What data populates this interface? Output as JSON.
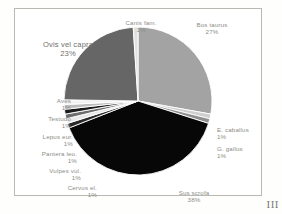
{
  "figure": {
    "plate_label": "III"
  },
  "chart_data": {
    "type": "pie",
    "title": "",
    "legend": "none (labels placed around slices)",
    "units": "percent",
    "categories": [
      "Bos taurus",
      "Sus scrofa",
      "Cervus el.",
      "Vulpes vul.",
      "Pantera leo.",
      "Lepus eur.",
      "Testudo",
      "Aves",
      "Ovis vel capra",
      "Canis fam.",
      "E. caballus",
      "G. gallus"
    ],
    "values": [
      27,
      38,
      1,
      1,
      1,
      1,
      1,
      1,
      23,
      1,
      1,
      1
    ],
    "slices": [
      {
        "label": "Bos taurus",
        "percent": 27,
        "percent_text": "27%",
        "color": "#a3a3a3"
      },
      {
        "label": "E. caballus",
        "percent": 1,
        "percent_text": "1%",
        "color": "#cfcfcf"
      },
      {
        "label": "G. gallus",
        "percent": 1,
        "percent_text": "1%",
        "color": "#8f8f8f"
      },
      {
        "label": "Sus scrofa",
        "percent": 38,
        "percent_text": "38%",
        "color": "#070707"
      },
      {
        "label": "Cervus el.",
        "percent": 1,
        "percent_text": "1%",
        "color": "#2b2b2b"
      },
      {
        "label": "Vulpes vul.",
        "percent": 1,
        "percent_text": "1%",
        "color": "#e8e8e8"
      },
      {
        "label": "Pantera leo.",
        "percent": 1,
        "percent_text": "1%",
        "color": "#6e6e6e"
      },
      {
        "label": "Lepus eur.",
        "percent": 1,
        "percent_text": "1%",
        "color": "#1a1a1a"
      },
      {
        "label": "Testudo",
        "percent": 1,
        "percent_text": "1%",
        "color": "#bcbcbc"
      },
      {
        "label": "Aves",
        "percent": 1,
        "percent_text": "1%",
        "color": "#f2f2f2"
      },
      {
        "label": "Ovis vel capra",
        "percent": 23,
        "percent_text": "23%",
        "color": "#666666"
      },
      {
        "label": "Canis fam.",
        "percent": 1,
        "percent_text": "1%",
        "color": "#e0e0e0"
      }
    ],
    "start_angle_deg": 0,
    "direction": "clockwise",
    "xlabel": "",
    "ylabel": "",
    "grid": false
  },
  "labels": {
    "canis": {
      "name": "Canis fam.",
      "pct": "1%"
    },
    "bos": {
      "name": "Bos taurus",
      "pct": "27%"
    },
    "ovis": {
      "name": "Ovis vel capra",
      "pct": "23%"
    },
    "aves": {
      "name": "Aves",
      "pct": "1%"
    },
    "testudo": {
      "name": "Testudo",
      "pct": "1%"
    },
    "lepus": {
      "name": "Lepus eur.",
      "pct": "1%"
    },
    "pantera": {
      "name": "Pantera leo.",
      "pct": "1%"
    },
    "vulpes": {
      "name": "Vulpes vul.",
      "pct": "1%"
    },
    "cervus": {
      "name": "Cervus el.",
      "pct": "1%"
    },
    "sus": {
      "name": "Sus scrofa",
      "pct": "38%"
    },
    "ecaballus": {
      "name": "E. caballus",
      "pct": "1%"
    },
    "ggallus": {
      "name": "G. gallus",
      "pct": "1%"
    }
  }
}
